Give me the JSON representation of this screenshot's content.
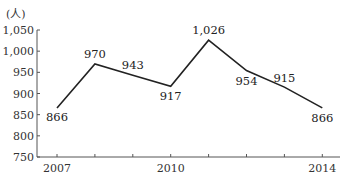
{
  "chart_data": {
    "type": "line",
    "title": "",
    "xlabel": "",
    "ylabel": "(人)",
    "unit_label": "(人)",
    "x": [
      2007,
      2008,
      2009,
      2010,
      2011,
      2012,
      2013,
      2014
    ],
    "x_tick_labels": [
      "2007",
      "",
      "",
      "2010",
      "",
      "",
      "",
      "2014"
    ],
    "values": [
      866,
      970,
      943,
      917,
      1026,
      954,
      915,
      866
    ],
    "data_labels": [
      "866",
      "970",
      "943",
      "917",
      "1,026",
      "954",
      "915",
      "866"
    ],
    "y_ticks": [
      750,
      800,
      850,
      900,
      950,
      1000,
      1050
    ],
    "y_tick_labels": [
      "750",
      "800",
      "850",
      "900",
      "950",
      "1,000",
      "1,050"
    ],
    "ylim": [
      750,
      1050
    ],
    "grid": false,
    "legend": null,
    "series": [
      {
        "name": "",
        "values": [
          866,
          970,
          943,
          917,
          1026,
          954,
          915,
          866
        ]
      }
    ]
  }
}
